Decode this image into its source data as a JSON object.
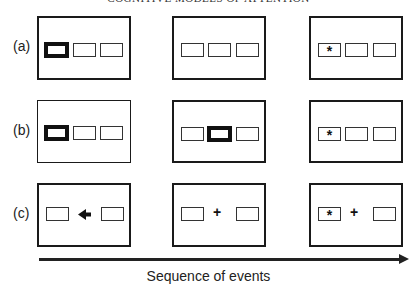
{
  "header": {
    "title": "COGNITIVE MODELS OF ATTENTION"
  },
  "rows": [
    {
      "label": "(a)"
    },
    {
      "label": "(b)"
    },
    {
      "label": "(c)"
    }
  ],
  "symbols": {
    "target": "*",
    "fixation": "+",
    "cue_arrow": "left-arrow"
  },
  "timeline": {
    "label": "Sequence of events"
  }
}
